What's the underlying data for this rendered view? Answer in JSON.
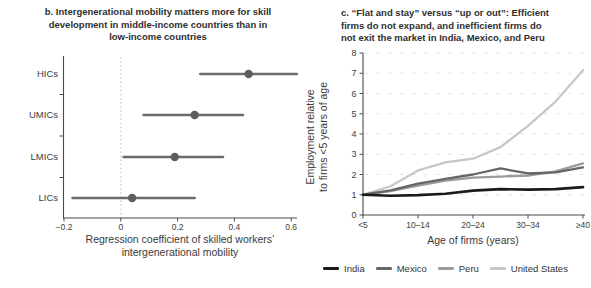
{
  "panels": {
    "b": {
      "title": "b. Intergenerational mobility matters more for skill\ndevelopment in middle-income countries than in\nlow-income countries",
      "xlabel": "Regression coefficient of skilled workers’\nintergenerational mobility"
    },
    "c": {
      "title": "c. “Flat and stay” versus “up or out”: Efficient\nfirms do not expand, and inefficient firms do\nnot exit the market in India, Mexico, and Peru",
      "xlabel": "Age of firms (years)",
      "ylabel": "Employment relative\nto firms <5 years of age"
    }
  },
  "colors": {
    "axis": "#4a4a4a",
    "tick_text": "#3d3d3d",
    "gridline": "#e5e5e5",
    "zero_line": "#c9c9c9",
    "forest_marker": "#5d5d5d",
    "forest_whisker": "#6b6b6b"
  },
  "chart_data": [
    {
      "type": "scatter",
      "subtype": "dot-and-whisker",
      "panel": "b",
      "title": "b. Intergenerational mobility matters more for skill development in middle-income countries than in low-income countries",
      "categories": [
        "HICs",
        "UMICs",
        "LMICs",
        "LICs"
      ],
      "estimates": [
        0.45,
        0.26,
        0.19,
        0.04
      ],
      "ci_low": [
        0.28,
        0.08,
        0.01,
        -0.17
      ],
      "ci_high": [
        0.62,
        0.43,
        0.36,
        0.26
      ],
      "xlabel": "Regression coefficient of skilled workers’ intergenerational mobility",
      "xticks": [
        -0.2,
        0,
        0.2,
        0.4,
        0.6
      ],
      "xtick_labels": [
        "−0.2",
        "0",
        "0.2",
        "0.4",
        "0.6"
      ],
      "xlim": [
        -0.2,
        0.65
      ],
      "zero_reference_line": 0,
      "grid": false,
      "legend_position": "none"
    },
    {
      "type": "line",
      "panel": "c",
      "title": "c. “Flat and stay” versus “up or out”: Efficient firms do not expand, and inefficient firms do not exit the market in India, Mexico, and Peru",
      "categories": [
        "<5",
        "5–9",
        "10–14",
        "15–19",
        "20–24",
        "25–29",
        "30–34",
        "35–39",
        "≥40"
      ],
      "xtick_indices": [
        0,
        2,
        4,
        6,
        8
      ],
      "series": [
        {
          "name": "India",
          "color": "#1b1b1b",
          "values": [
            1.0,
            0.95,
            0.98,
            1.05,
            1.2,
            1.28,
            1.25,
            1.28,
            1.38
          ]
        },
        {
          "name": "Mexico",
          "color": "#666666",
          "values": [
            1.0,
            1.22,
            1.55,
            1.78,
            2.0,
            2.3,
            2.05,
            2.1,
            2.35
          ]
        },
        {
          "name": "Peru",
          "color": "#9b9b9b",
          "values": [
            1.0,
            1.18,
            1.45,
            1.7,
            1.85,
            1.9,
            1.95,
            2.15,
            2.55
          ]
        },
        {
          "name": "United States",
          "color": "#c7c7c7",
          "values": [
            1.0,
            1.42,
            2.2,
            2.6,
            2.78,
            3.35,
            4.4,
            5.6,
            7.15
          ]
        }
      ],
      "xlabel": "Age of firms (years)",
      "ylabel": "Employment relative to firms <5 years of age",
      "ylim": [
        0,
        8
      ],
      "yticks": [
        0,
        1,
        2,
        3,
        4,
        5,
        6,
        7,
        8
      ],
      "grid": true,
      "legend_position": "bottom"
    }
  ]
}
